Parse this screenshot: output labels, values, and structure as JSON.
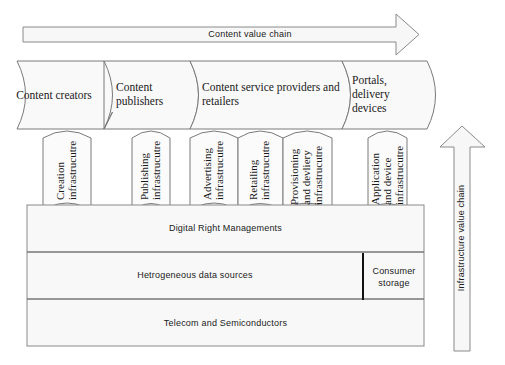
{
  "diagram": {
    "content_arrow": {
      "label": "Content value chain",
      "direction": "right"
    },
    "infrastructure_arrow": {
      "label": "Infrastructure value chain",
      "direction": "up"
    },
    "content_stages": [
      {
        "label": "Content creators"
      },
      {
        "label": "Content publishers"
      },
      {
        "label": "Content service providers and retailers"
      },
      {
        "label": "Portals, delivery devices"
      }
    ],
    "infrastructures": [
      {
        "line1": "Creation",
        "line2": "infrastrucutre"
      },
      {
        "line1": "Publishing",
        "line2": "infrastrucutre"
      },
      {
        "line1": "Advertising",
        "line2": "infrastrucutre"
      },
      {
        "line1": "Retailing",
        "line2": "infrastrucutre"
      },
      {
        "line1": "Provisioning",
        "line2": "and devliery",
        "line3": "infrastrucutre"
      },
      {
        "line1": "Application",
        "line2": "and device",
        "line3": "infrastrucutre"
      }
    ],
    "layers": [
      {
        "label": "Digital Right Managements"
      },
      {
        "label": "Hetrogeneous data sources",
        "side": "Consumer storage"
      },
      {
        "label": "Telecom and Semiconductors"
      }
    ],
    "colors": {
      "stroke": "#7a7a7a",
      "fill": "#f9f9f9",
      "divider": "#111111",
      "text": "#1a1a1a"
    }
  }
}
